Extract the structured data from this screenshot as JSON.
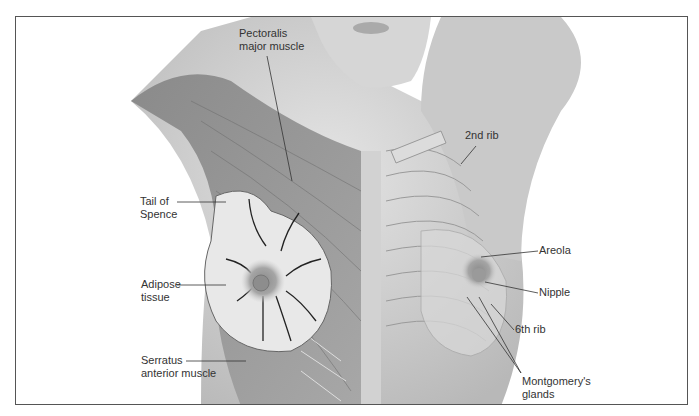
{
  "figure": {
    "labels": {
      "pectoralis_line1": "Pectoralis",
      "pectoralis_line2": "major muscle",
      "tail_line1": "Tail of",
      "tail_line2": "Spence",
      "adipose_line1": "Adipose",
      "adipose_line2": "tissue",
      "serratus_line1": "Serratus",
      "serratus_line2": "anterior muscle",
      "second_rib": "2nd rib",
      "areola": "Areola",
      "nipple": "Nipple",
      "sixth_rib": "6th rib",
      "montgomery_line1": "Montgomery's",
      "montgomery_line2": "glands"
    }
  }
}
